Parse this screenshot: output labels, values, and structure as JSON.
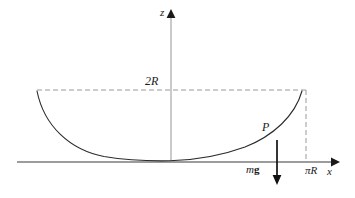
{
  "figure": {
    "type": "physics-diagram",
    "background_color": "#ffffff",
    "stroke_color": "#1a1a1a",
    "dash_color": "#9a9a9a"
  },
  "axes": {
    "vertical": {
      "label": "z",
      "label_x": 164,
      "label_y": 13,
      "x_px": 171,
      "top_px": 14,
      "bottom_px": 162
    },
    "horizontal": {
      "label": "x",
      "label_x": 330,
      "label_y": 172,
      "y_px": 162,
      "left_px": 17,
      "right_px": 333
    }
  },
  "curve": {
    "name": "cycloid-arc",
    "left_end": {
      "x": 37,
      "y": 91
    },
    "right_end": {
      "x": 302,
      "y": 91
    },
    "vertex": {
      "x": 170,
      "y": 160
    },
    "path": "M 37 91 C 44 125, 70 150, 105 156 C 128 160, 150 161, 170 160.5 C 192 160, 218 157, 243 148 C 272 137, 294 116, 302 91"
  },
  "guides": {
    "horizontal_dashed": {
      "name": "height-2R-guide",
      "y": 90,
      "x_start": 37,
      "x_end": 306
    },
    "vertical_dashed": {
      "name": "piR-guide",
      "x": 306,
      "y_start": 90,
      "y_end": 162
    }
  },
  "labels": {
    "height": "2R",
    "half_period": "πR",
    "point": "P",
    "force_italic": "m",
    "force_upright": "g",
    "force_full": "mg"
  },
  "force_vector": {
    "name": "gravity-arrow",
    "from": {
      "x": 277,
      "y": 140
    },
    "to": {
      "x": 277,
      "y": 184
    },
    "direction": "down"
  }
}
